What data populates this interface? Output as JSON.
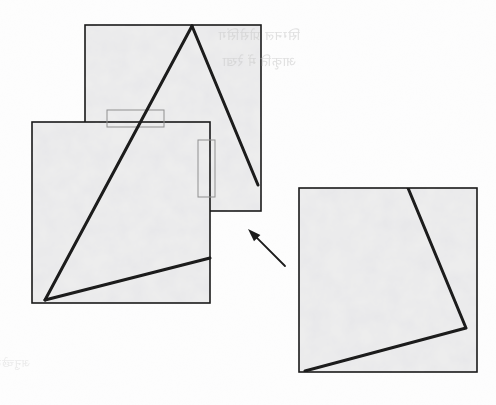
{
  "document": {
    "kind": "scanned-geometry-figure",
    "page_background": "#fdfdfd",
    "ink_color": "#1a1a1a",
    "fill_color": "#ededed",
    "texture_color": "#d6d6d6",
    "thin_line_color": "#8f8f8f",
    "width": 496,
    "height": 405
  },
  "bleed_through_text": {
    "line1": "सिग्नल प्रोसेसिंग",
    "line2": "आकृति में रेखा",
    "line3": "अनुच्छेद"
  },
  "figure": {
    "squares": [
      {
        "name": "top-square",
        "x": 85,
        "y": 25,
        "width": 176,
        "height": 186,
        "stroke_width": 1.6
      },
      {
        "name": "left-square",
        "x": 32,
        "y": 122,
        "width": 178,
        "height": 181,
        "stroke_width": 1.6
      },
      {
        "name": "right-square",
        "x": 299,
        "y": 188,
        "width": 178,
        "height": 184,
        "stroke_width": 1.6
      }
    ],
    "triangle": {
      "name": "inscribed-triangle",
      "apex": [
        192,
        26
      ],
      "left_base": [
        45,
        300
      ],
      "right_base": [
        258,
        185
      ],
      "stroke_width": 3.0
    },
    "left_square_chord": {
      "name": "left-square-chord",
      "from": [
        45,
        300
      ],
      "to": [
        210,
        258
      ],
      "stroke_width": 3.0
    },
    "right_quadrilateral": {
      "name": "right-square-quadrilateral",
      "points": [
        [
          408,
          188
        ],
        [
          466,
          328
        ],
        [
          305,
          371
        ]
      ],
      "stroke_width": 3.0
    },
    "marker_rectangles": [
      {
        "name": "horizontal-marker-rect",
        "x": 107,
        "y": 110,
        "width": 57,
        "height": 17,
        "stroke_width": 1.0
      },
      {
        "name": "vertical-marker-rect",
        "x": 198,
        "y": 140,
        "width": 17,
        "height": 57,
        "stroke_width": 1.0
      }
    ],
    "arrow": {
      "name": "translation-arrow",
      "tail": [
        285,
        266
      ],
      "head": [
        248,
        229
      ],
      "stroke_width": 1.8,
      "head_length": 13,
      "head_half_width": 4.5
    }
  }
}
